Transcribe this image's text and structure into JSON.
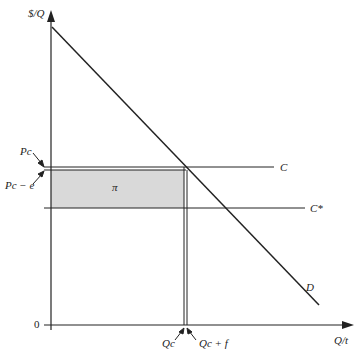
{
  "diagram": {
    "y_axis_label": "$/Q",
    "x_axis_label": "Q/t",
    "origin_label": "0",
    "price_labels": {
      "pc": "Pc",
      "pc_minus_e": "Pc − e"
    },
    "quantity_labels": {
      "qc": "Qc",
      "qc_plus_f": "Qc + f"
    },
    "curve_labels": {
      "c": "C",
      "c_star": "C*",
      "d": "D"
    },
    "area_label": "π",
    "colors": {
      "line": "#222222",
      "shade": "#d9d9d9"
    }
  }
}
